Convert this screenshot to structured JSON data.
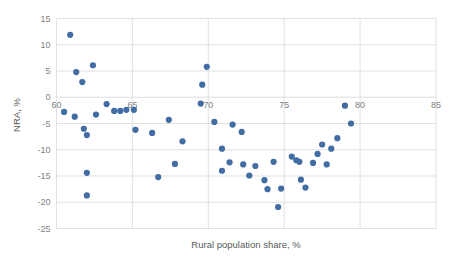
{
  "chart_data": {
    "type": "scatter",
    "title": "",
    "xlabel": "Rural population share, %",
    "ylabel": "NRA, %",
    "xlim": [
      60,
      85
    ],
    "ylim": [
      -25,
      15
    ],
    "xticks": [
      60,
      65,
      70,
      75,
      80,
      85
    ],
    "yticks": [
      15,
      10,
      5,
      0,
      -5,
      -10,
      -15,
      -20,
      -25
    ],
    "xticklabels": [
      "60",
      "65",
      "70",
      "75",
      "80",
      "85"
    ],
    "yticklabels": [
      "15",
      "10",
      "5",
      "0",
      "-5",
      "-10",
      "-15",
      "-20",
      "-25"
    ],
    "grid": true,
    "legend": false,
    "marker_color": "#416ca4",
    "series": [
      {
        "name": "",
        "points": [
          [
            60.5,
            -2.8
          ],
          [
            60.9,
            11.9
          ],
          [
            61.2,
            -3.7
          ],
          [
            61.3,
            4.8
          ],
          [
            61.7,
            2.9
          ],
          [
            61.8,
            -6.0
          ],
          [
            62.0,
            -7.2
          ],
          [
            62.0,
            -14.4
          ],
          [
            62.0,
            -18.7
          ],
          [
            62.4,
            6.1
          ],
          [
            62.6,
            -3.3
          ],
          [
            63.3,
            -1.3
          ],
          [
            63.8,
            -2.6
          ],
          [
            64.2,
            -2.6
          ],
          [
            64.6,
            -2.4
          ],
          [
            65.1,
            -2.4
          ],
          [
            65.2,
            -6.2
          ],
          [
            66.3,
            -6.8
          ],
          [
            66.7,
            -15.2
          ],
          [
            67.4,
            -4.3
          ],
          [
            67.8,
            -12.7
          ],
          [
            68.3,
            -8.4
          ],
          [
            69.5,
            -1.2
          ],
          [
            69.6,
            2.4
          ],
          [
            69.9,
            5.8
          ],
          [
            70.4,
            -4.7
          ],
          [
            70.9,
            -9.8
          ],
          [
            70.9,
            -14.0
          ],
          [
            71.4,
            -12.4
          ],
          [
            71.6,
            -5.2
          ],
          [
            72.2,
            -6.6
          ],
          [
            72.3,
            -12.8
          ],
          [
            72.7,
            -14.9
          ],
          [
            73.1,
            -13.1
          ],
          [
            73.7,
            -15.8
          ],
          [
            73.9,
            -17.5
          ],
          [
            74.3,
            -12.3
          ],
          [
            74.6,
            -20.9
          ],
          [
            74.8,
            -17.4
          ],
          [
            75.5,
            -11.3
          ],
          [
            75.8,
            -12.0
          ],
          [
            76.0,
            -12.3
          ],
          [
            76.1,
            -15.7
          ],
          [
            76.4,
            -17.2
          ],
          [
            76.9,
            -12.5
          ],
          [
            77.2,
            -10.8
          ],
          [
            77.5,
            -9.0
          ],
          [
            77.8,
            -12.8
          ],
          [
            78.1,
            -9.8
          ],
          [
            78.5,
            -7.8
          ],
          [
            79.0,
            -1.6
          ],
          [
            79.4,
            -5.0
          ]
        ]
      }
    ]
  },
  "axes": {
    "x_title": "Rural population share, %",
    "y_title": "NRA, %"
  }
}
